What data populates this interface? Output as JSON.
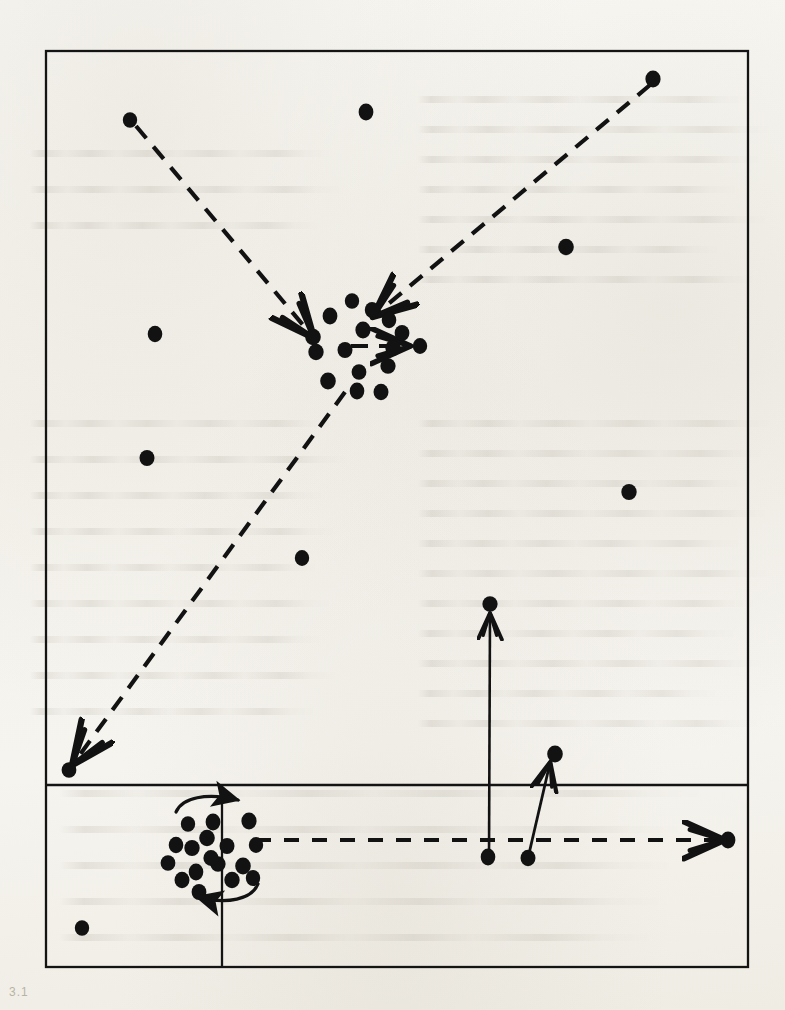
{
  "figure": {
    "background_color": "#f5f3ee",
    "ink_color": "#121212",
    "caption_mark": "3.1",
    "frame": {
      "x": 46,
      "y": 51,
      "width": 702,
      "height": 916,
      "stroke_width": 2.2,
      "horizontal_divider_y": 785,
      "vertical_divider_x": 222,
      "vertical_divider_y_start": 785,
      "vertical_divider_y_end": 967
    }
  },
  "chart_data": {
    "type": "scatter",
    "xlabel": "",
    "ylabel": "",
    "grid": false,
    "legend": null,
    "axis_ranges": {
      "x": [
        46,
        748
      ],
      "y": [
        51,
        967
      ]
    },
    "point_radius": 7.5,
    "series": [
      {
        "name": "upper-cluster",
        "marker": "filled-circle",
        "points": [
          [
            352,
            301
          ],
          [
            330,
            316
          ],
          [
            363,
            330
          ],
          [
            313,
            337
          ],
          [
            389,
            320
          ],
          [
            345,
            350
          ],
          [
            393,
            348
          ],
          [
            420,
            346
          ],
          [
            359,
            372
          ],
          [
            388,
            366
          ],
          [
            328,
            381
          ],
          [
            357,
            391
          ],
          [
            381,
            392
          ],
          [
            316,
            352
          ],
          [
            372,
            310
          ],
          [
            402,
            333
          ]
        ]
      },
      {
        "name": "upper-scatter",
        "marker": "filled-circle",
        "points": [
          [
            130,
            120
          ],
          [
            366,
            112
          ],
          [
            653,
            79
          ],
          [
            566,
            247
          ],
          [
            155,
            334
          ],
          [
            147,
            458
          ],
          [
            629,
            492
          ],
          [
            302,
            558
          ],
          [
            69,
            770
          ],
          [
            490,
            604
          ],
          [
            555,
            754
          ],
          [
            488,
            857
          ],
          [
            528,
            858
          ]
        ]
      },
      {
        "name": "lower-cluster",
        "marker": "filled-circle",
        "points": [
          [
            188,
            824
          ],
          [
            213,
            822
          ],
          [
            249,
            821
          ],
          [
            207,
            838
          ],
          [
            176,
            845
          ],
          [
            227,
            846
          ],
          [
            192,
            848
          ],
          [
            256,
            845
          ],
          [
            168,
            863
          ],
          [
            218,
            864
          ],
          [
            243,
            866
          ],
          [
            196,
            872
          ],
          [
            182,
            880
          ],
          [
            232,
            880
          ],
          [
            253,
            878
          ],
          [
            199,
            892
          ],
          [
            211,
            858
          ]
        ]
      },
      {
        "name": "lower-scatter",
        "marker": "filled-circle",
        "points": [
          [
            82,
            928
          ],
          [
            728,
            840
          ]
        ]
      }
    ],
    "arrows": [
      {
        "name": "nw-dashed-into-cluster",
        "style": "dashed",
        "from": [
          136,
          126
        ],
        "to": [
          313,
          337
        ],
        "head": "open-v"
      },
      {
        "name": "ne-dashed-into-cluster",
        "style": "dashed",
        "from": [
          650,
          85
        ],
        "to": [
          374,
          316
        ],
        "head": "open-v"
      },
      {
        "name": "cluster-to-sw-dashed",
        "style": "dashed",
        "from": [
          345,
          392
        ],
        "to": [
          73,
          764
        ],
        "head": "open-v"
      },
      {
        "name": "cluster-east-dashed-stub",
        "style": "dashed",
        "from": [
          352,
          346
        ],
        "to": [
          411,
          346
        ],
        "head": "open-v"
      },
      {
        "name": "bottom-long-dashed-east",
        "style": "dashed",
        "from": [
          256,
          840
        ],
        "to": [
          724,
          840
        ],
        "head": "open-v"
      },
      {
        "name": "solid-vertical-up",
        "style": "solid",
        "from": [
          489,
          857
        ],
        "to": [
          490,
          612
        ],
        "head": "open-v"
      },
      {
        "name": "solid-diagonal-up-right",
        "style": "solid",
        "from": [
          528,
          858
        ],
        "to": [
          551,
          761
        ],
        "head": "open-v"
      },
      {
        "name": "curved-arrow-top-clockwise",
        "style": "solid-curved",
        "from": [
          178,
          808
        ],
        "to": [
          246,
          801
        ],
        "head": "solid-triangle"
      },
      {
        "name": "curved-arrow-bottom-counterclockwise",
        "style": "solid-curved",
        "from": [
          254,
          888
        ],
        "to": [
          189,
          896
        ],
        "head": "solid-triangle"
      }
    ],
    "annotations": [
      {
        "name": "cluster-count-upper",
        "value": 16,
        "label": "dots in upper cluster"
      },
      {
        "name": "cluster-count-lower",
        "value": 17,
        "label": "dots in lower cluster"
      },
      {
        "name": "dashed-arrow-count",
        "value": 5,
        "label": "dashed arrows"
      },
      {
        "name": "solid-arrow-count",
        "value": 4,
        "label": "solid arrows"
      }
    ]
  }
}
